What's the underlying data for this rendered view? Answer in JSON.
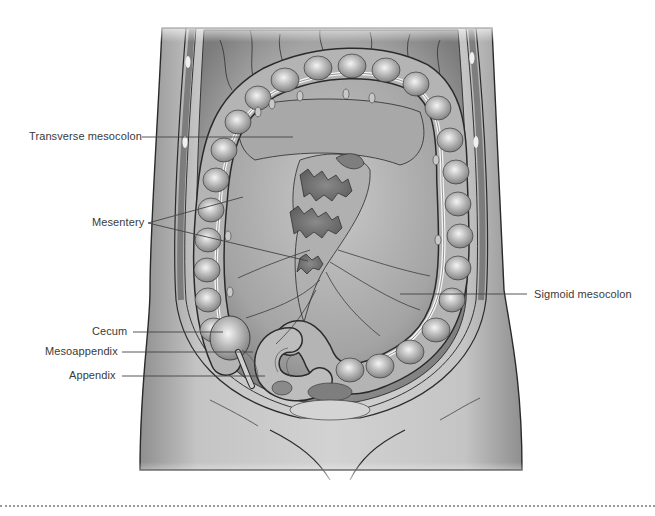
{
  "figure": {
    "style": "grayscale anatomical illustration"
  },
  "labels": [
    {
      "id": "transverse-mesocolon",
      "text": "Transverse mesocolon",
      "side": "left"
    },
    {
      "id": "mesentery",
      "text": "Mesentery",
      "side": "left"
    },
    {
      "id": "sigmoid-mesocolon",
      "text": "Sigmoid mesocolon",
      "side": "right"
    },
    {
      "id": "cecum",
      "text": "Cecum",
      "side": "left"
    },
    {
      "id": "mesoappendix",
      "text": "Mesoappendix",
      "side": "left"
    },
    {
      "id": "appendix",
      "text": "Appendix",
      "side": "left"
    }
  ],
  "colors": {
    "label_text": "#3a3a3a",
    "leader_line": "#444444",
    "outline": "#2a2a2a",
    "body_fill": "#bdbdbd",
    "colon_fill": "#a9a9a9",
    "colon_highlight": "#e6e6e6",
    "cavity_fill": "#9c9c9c",
    "wall_dark": "#6e6e6e",
    "divider_dots": "#9a9a9a"
  }
}
